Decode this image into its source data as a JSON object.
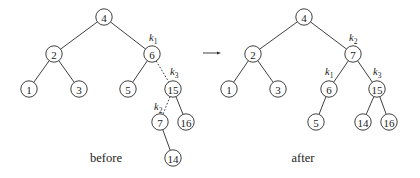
{
  "diagram": {
    "type": "binary-search-tree-rotation",
    "arrow": {
      "x1": 203,
      "x2": 221,
      "y": 53
    },
    "before": {
      "caption": {
        "text": "before",
        "x": 106,
        "y": 162
      },
      "nodes": [
        {
          "id": "b4",
          "label": "4",
          "x": 104,
          "y": 17
        },
        {
          "id": "b2",
          "label": "2",
          "x": 54,
          "y": 54
        },
        {
          "id": "b6",
          "label": "6",
          "x": 152,
          "y": 54
        },
        {
          "id": "b1",
          "label": "1",
          "x": 29,
          "y": 89
        },
        {
          "id": "b3",
          "label": "3",
          "x": 79,
          "y": 89
        },
        {
          "id": "b5",
          "label": "5",
          "x": 128,
          "y": 89
        },
        {
          "id": "b15",
          "label": "15",
          "x": 173,
          "y": 89
        },
        {
          "id": "b7",
          "label": "7",
          "x": 160,
          "y": 122
        },
        {
          "id": "b16",
          "label": "16",
          "x": 186,
          "y": 122
        },
        {
          "id": "b14",
          "label": "14",
          "x": 173,
          "y": 158
        }
      ],
      "edges": [
        {
          "from": "b4",
          "to": "b2",
          "style": "solid"
        },
        {
          "from": "b4",
          "to": "b6",
          "style": "solid"
        },
        {
          "from": "b2",
          "to": "b1",
          "style": "solid"
        },
        {
          "from": "b2",
          "to": "b3",
          "style": "solid"
        },
        {
          "from": "b6",
          "to": "b5",
          "style": "solid"
        },
        {
          "from": "b6",
          "to": "b15",
          "style": "dotted"
        },
        {
          "from": "b15",
          "to": "b7",
          "style": "dotted"
        },
        {
          "from": "b15",
          "to": "b16",
          "style": "solid"
        },
        {
          "from": "b7",
          "to": "b14",
          "style": "solid"
        }
      ],
      "labels": [
        {
          "text": "k",
          "sub": "1",
          "node": "b6",
          "x": 149,
          "y": 41
        },
        {
          "text": "k",
          "sub": "3",
          "node": "b15",
          "x": 170,
          "y": 75
        },
        {
          "text": "k",
          "sub": "2",
          "node": "b7",
          "x": 154,
          "y": 110
        }
      ]
    },
    "after": {
      "caption": {
        "text": "after",
        "x": 303,
        "y": 162
      },
      "nodes": [
        {
          "id": "a4",
          "label": "4",
          "x": 304,
          "y": 17
        },
        {
          "id": "a2",
          "label": "2",
          "x": 253,
          "y": 54
        },
        {
          "id": "a7",
          "label": "7",
          "x": 353,
          "y": 54
        },
        {
          "id": "a1",
          "label": "1",
          "x": 229,
          "y": 89
        },
        {
          "id": "a3",
          "label": "3",
          "x": 278,
          "y": 89
        },
        {
          "id": "a6",
          "label": "6",
          "x": 329,
          "y": 89
        },
        {
          "id": "a15",
          "label": "15",
          "x": 377,
          "y": 89
        },
        {
          "id": "a5",
          "label": "5",
          "x": 316,
          "y": 122
        },
        {
          "id": "a14",
          "label": "14",
          "x": 363,
          "y": 122
        },
        {
          "id": "a16",
          "label": "16",
          "x": 389,
          "y": 122
        }
      ],
      "edges": [
        {
          "from": "a4",
          "to": "a2",
          "style": "solid"
        },
        {
          "from": "a4",
          "to": "a7",
          "style": "solid"
        },
        {
          "from": "a2",
          "to": "a1",
          "style": "solid"
        },
        {
          "from": "a2",
          "to": "a3",
          "style": "solid"
        },
        {
          "from": "a7",
          "to": "a6",
          "style": "solid"
        },
        {
          "from": "a7",
          "to": "a15",
          "style": "solid"
        },
        {
          "from": "a6",
          "to": "a5",
          "style": "solid"
        },
        {
          "from": "a15",
          "to": "a14",
          "style": "solid"
        },
        {
          "from": "a15",
          "to": "a16",
          "style": "solid"
        }
      ],
      "labels": [
        {
          "text": "k",
          "sub": "2",
          "node": "a7",
          "x": 349,
          "y": 41
        },
        {
          "text": "k",
          "sub": "1",
          "node": "a6",
          "x": 325,
          "y": 75
        },
        {
          "text": "k",
          "sub": "3",
          "node": "a15",
          "x": 373,
          "y": 75
        }
      ]
    },
    "node_radius": 8.2
  }
}
